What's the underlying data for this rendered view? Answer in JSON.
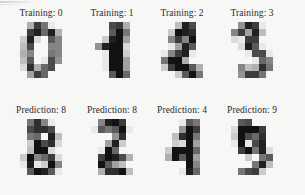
{
  "figure": {
    "background_color": "#f7f7f6",
    "ink_color": "#2b2b2b",
    "colormap": "gray_r",
    "grid_rows": 2,
    "grid_cols": 4,
    "digit_resolution": "8x8"
  },
  "rows": [
    {
      "name": "training-row",
      "panels": [
        {
          "label_prefix": "Training",
          "separator": ":",
          "value": "0",
          "title": "Training: 0",
          "digit_name": "digit-zero"
        },
        {
          "label_prefix": "Training",
          "separator": ":",
          "value": "1",
          "title": "Training: 1",
          "digit_name": "digit-one"
        },
        {
          "label_prefix": "Training",
          "separator": ":",
          "value": "2",
          "title": "Training: 2",
          "digit_name": "digit-two"
        },
        {
          "label_prefix": "Training",
          "separator": ":",
          "value": "3",
          "title": "Training: 3",
          "digit_name": "digit-three"
        }
      ]
    },
    {
      "name": "prediction-row",
      "panels": [
        {
          "label_prefix": "Prediction",
          "separator": ":",
          "value": "8",
          "title": "Prediction: 8",
          "digit_name": "digit-eight-a"
        },
        {
          "label_prefix": "Prediction",
          "separator": ":",
          "value": "8",
          "title": "Prediction: 8",
          "digit_name": "digit-eight-b"
        },
        {
          "label_prefix": "Prediction",
          "separator": ":",
          "value": "4",
          "title": "Prediction: 4",
          "digit_name": "digit-four"
        },
        {
          "label_prefix": "Prediction",
          "separator": ":",
          "value": "9",
          "title": "Prediction: 9",
          "digit_name": "digit-nine"
        }
      ]
    }
  ],
  "chart_data": {
    "type": "heatmap",
    "title": "",
    "xlabel": "",
    "ylabel": "",
    "colormap": "gray_r",
    "value_range": [
      0,
      16
    ],
    "panels": [
      {
        "title": "Training: 0",
        "label": "0",
        "matrix": [
          [
            0,
            0,
            5,
            13,
            9,
            1,
            0,
            0
          ],
          [
            0,
            0,
            13,
            15,
            10,
            15,
            5,
            0
          ],
          [
            0,
            3,
            15,
            2,
            0,
            11,
            8,
            0
          ],
          [
            0,
            4,
            12,
            0,
            0,
            8,
            8,
            0
          ],
          [
            0,
            5,
            8,
            0,
            0,
            9,
            8,
            0
          ],
          [
            0,
            4,
            11,
            0,
            1,
            12,
            7,
            0
          ],
          [
            0,
            2,
            14,
            5,
            10,
            12,
            0,
            0
          ],
          [
            0,
            0,
            6,
            13,
            10,
            0,
            0,
            0
          ]
        ]
      },
      {
        "title": "Training: 1",
        "label": "1",
        "matrix": [
          [
            0,
            0,
            0,
            12,
            13,
            5,
            0,
            0
          ],
          [
            0,
            0,
            0,
            11,
            16,
            9,
            0,
            0
          ],
          [
            0,
            0,
            3,
            15,
            16,
            6,
            0,
            0
          ],
          [
            0,
            7,
            15,
            16,
            16,
            2,
            0,
            0
          ],
          [
            0,
            0,
            1,
            16,
            16,
            3,
            0,
            0
          ],
          [
            0,
            0,
            1,
            16,
            16,
            6,
            0,
            0
          ],
          [
            0,
            0,
            1,
            16,
            16,
            6,
            0,
            0
          ],
          [
            0,
            0,
            0,
            11,
            16,
            10,
            0,
            0
          ]
        ]
      },
      {
        "title": "Training: 2",
        "label": "2",
        "matrix": [
          [
            0,
            0,
            0,
            4,
            15,
            12,
            0,
            0
          ],
          [
            0,
            0,
            3,
            16,
            15,
            14,
            0,
            0
          ],
          [
            0,
            0,
            8,
            13,
            8,
            16,
            0,
            0
          ],
          [
            0,
            0,
            1,
            6,
            15,
            11,
            0,
            0
          ],
          [
            0,
            1,
            8,
            13,
            15,
            1,
            0,
            0
          ],
          [
            0,
            9,
            16,
            16,
            5,
            0,
            0,
            0
          ],
          [
            0,
            3,
            13,
            16,
            16,
            11,
            5,
            0
          ],
          [
            0,
            0,
            0,
            3,
            11,
            16,
            9,
            0
          ]
        ]
      },
      {
        "title": "Training: 3",
        "label": "3",
        "matrix": [
          [
            0,
            0,
            7,
            15,
            13,
            1,
            0,
            0
          ],
          [
            0,
            8,
            13,
            6,
            15,
            4,
            0,
            0
          ],
          [
            0,
            2,
            1,
            13,
            13,
            0,
            0,
            0
          ],
          [
            0,
            0,
            2,
            15,
            11,
            1,
            0,
            0
          ],
          [
            0,
            0,
            0,
            1,
            12,
            12,
            1,
            0
          ],
          [
            0,
            0,
            0,
            0,
            1,
            10,
            8,
            0
          ],
          [
            0,
            0,
            8,
            4,
            5,
            14,
            9,
            0
          ],
          [
            0,
            0,
            7,
            13,
            13,
            9,
            0,
            0
          ]
        ]
      },
      {
        "title": "Prediction: 8",
        "label": "8",
        "matrix": [
          [
            0,
            0,
            9,
            14,
            8,
            1,
            0,
            0
          ],
          [
            0,
            0,
            12,
            14,
            14,
            12,
            0,
            0
          ],
          [
            0,
            0,
            9,
            10,
            0,
            15,
            4,
            0
          ],
          [
            0,
            0,
            3,
            16,
            12,
            14,
            2,
            0
          ],
          [
            0,
            0,
            4,
            16,
            16,
            2,
            0,
            0
          ],
          [
            0,
            3,
            16,
            8,
            10,
            13,
            2,
            0
          ],
          [
            0,
            1,
            15,
            1,
            3,
            16,
            8,
            0
          ],
          [
            0,
            0,
            11,
            16,
            15,
            11,
            1,
            0
          ]
        ]
      },
      {
        "title": "Prediction: 8",
        "label": "8",
        "matrix": [
          [
            0,
            0,
            8,
            15,
            16,
            13,
            0,
            0
          ],
          [
            0,
            1,
            11,
            9,
            11,
            16,
            1,
            0
          ],
          [
            0,
            0,
            0,
            0,
            7,
            14,
            0,
            0
          ],
          [
            0,
            0,
            0,
            6,
            15,
            3,
            0,
            0
          ],
          [
            0,
            0,
            1,
            16,
            10,
            0,
            0,
            0
          ],
          [
            0,
            0,
            13,
            16,
            15,
            12,
            5,
            0
          ],
          [
            0,
            0,
            16,
            11,
            6,
            4,
            0,
            0
          ],
          [
            0,
            0,
            5,
            14,
            14,
            16,
            4,
            0
          ]
        ]
      },
      {
        "title": "Prediction: 4",
        "label": "4",
        "matrix": [
          [
            0,
            0,
            0,
            1,
            11,
            9,
            0,
            0
          ],
          [
            0,
            0,
            0,
            7,
            16,
            13,
            0,
            0
          ],
          [
            0,
            0,
            4,
            14,
            16,
            9,
            0,
            0
          ],
          [
            0,
            0,
            3,
            2,
            16,
            6,
            0,
            0
          ],
          [
            0,
            3,
            16,
            16,
            16,
            10,
            0,
            0
          ],
          [
            0,
            5,
            16,
            11,
            16,
            6,
            0,
            0
          ],
          [
            0,
            0,
            0,
            0,
            16,
            8,
            0,
            0
          ],
          [
            0,
            0,
            0,
            1,
            15,
            10,
            0,
            0
          ]
        ]
      },
      {
        "title": "Prediction: 9",
        "label": "9",
        "matrix": [
          [
            0,
            0,
            11,
            12,
            0,
            0,
            0,
            0
          ],
          [
            0,
            2,
            16,
            16,
            16,
            13,
            0,
            0
          ],
          [
            0,
            3,
            16,
            12,
            10,
            14,
            0,
            0
          ],
          [
            0,
            1,
            16,
            1,
            12,
            15,
            0,
            0
          ],
          [
            0,
            0,
            13,
            16,
            9,
            15,
            2,
            0
          ],
          [
            0,
            0,
            0,
            3,
            0,
            9,
            11,
            0
          ],
          [
            0,
            0,
            0,
            0,
            9,
            15,
            4,
            0
          ],
          [
            0,
            0,
            9,
            12,
            13,
            3,
            0,
            0
          ]
        ]
      }
    ]
  }
}
